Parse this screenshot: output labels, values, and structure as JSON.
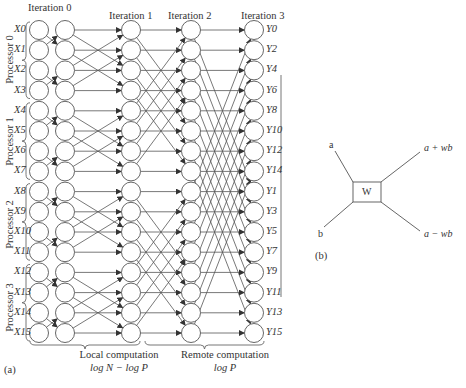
{
  "figure_a": {
    "panel_label": "(a)",
    "iterations": [
      "Iteration 0",
      "Iteration 1",
      "Iteration 2",
      "Iteration 3"
    ],
    "inputs": [
      "X0",
      "X1",
      "X2",
      "X3",
      "X4",
      "X5",
      "X6",
      "X7",
      "X8",
      "X9",
      "X10",
      "X11",
      "X12",
      "X13",
      "X14",
      "X15"
    ],
    "outputs": [
      "Y0",
      "Y2",
      "Y4",
      "Y6",
      "Y8",
      "Y10",
      "Y12",
      "Y14",
      "Y1",
      "Y3",
      "Y5",
      "Y7",
      "Y9",
      "Y11",
      "Y13",
      "Y15"
    ],
    "processors": [
      "Processor 0",
      "Processor 1",
      "Processor 2",
      "Processor 3"
    ],
    "local_label": "Local computation",
    "local_formula": "log N − log P",
    "remote_label": "Remote computation",
    "remote_formula": "log P"
  },
  "figure_b": {
    "panel_label": "(b)",
    "input_a": "a",
    "input_b": "b",
    "node_label": "W",
    "output_top": "a + wb",
    "output_bottom": "a − wb"
  },
  "colors": {
    "stroke": "#555555",
    "text": "#333333"
  }
}
